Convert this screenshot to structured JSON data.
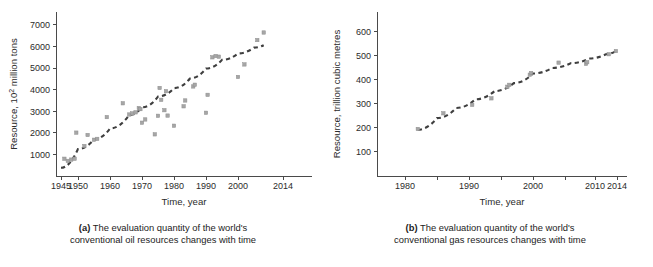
{
  "figure": {
    "panels": [
      {
        "id": "a",
        "tag": "(a)",
        "caption_line1": "The evaluation quantity of the world's",
        "caption_line2": "conventional oil resources changes with time"
      },
      {
        "id": "b",
        "tag": "(b)",
        "caption_line1": "The evaluation quantity of the world's",
        "caption_line2": "conventional gas resources changes with time"
      }
    ],
    "colors": {
      "point": "#a6a6a6",
      "trend": "#3f3f3f",
      "axis": "#4a4a4a",
      "text": "#2b2b2b",
      "background": "#ffffff"
    }
  },
  "chart_data": [
    {
      "type": "scatter",
      "panel": "a",
      "title": "",
      "xlabel": "Time, year",
      "ylabel": "Resource, 10² million tons",
      "ylabel_parts": {
        "prefix": "Resource, 10",
        "sup": "2",
        "suffix": " million tons"
      },
      "xlim": [
        1943,
        2018
      ],
      "ylim": [
        0,
        7600
      ],
      "grid": false,
      "legend": "none",
      "xticks": [
        1945,
        1950,
        1960,
        1970,
        1980,
        1990,
        2000,
        2014
      ],
      "xticklabels": [
        "1945",
        "1950",
        "1960",
        "1970",
        "1980",
        "1990",
        "2000",
        "2014"
      ],
      "yticks": [
        1000,
        2000,
        3000,
        4000,
        5000,
        6000,
        7000
      ],
      "yticklabels": [
        "1000",
        "2000",
        "3000",
        "4000",
        "5000",
        "6000",
        "7000"
      ],
      "points": [
        [
          1946,
          800
        ],
        [
          1947,
          700
        ],
        [
          1948,
          760
        ],
        [
          1949,
          800
        ],
        [
          1949.5,
          2010
        ],
        [
          1953,
          1900
        ],
        [
          1955,
          1680
        ],
        [
          1956,
          1720
        ],
        [
          1952,
          1390
        ],
        [
          1959,
          2730
        ],
        [
          1964,
          3370
        ],
        [
          1966,
          2850
        ],
        [
          1967,
          2900
        ],
        [
          1968,
          2950
        ],
        [
          1969,
          3150
        ],
        [
          1969.5,
          3100
        ],
        [
          1970,
          2470
        ],
        [
          1971,
          2620
        ],
        [
          1974,
          1930
        ],
        [
          1975,
          2790
        ],
        [
          1975.5,
          4080
        ],
        [
          1976,
          3530
        ],
        [
          1977,
          3050
        ],
        [
          1977.5,
          3930
        ],
        [
          1978,
          2800
        ],
        [
          1980,
          2330
        ],
        [
          1983,
          3230
        ],
        [
          1983.5,
          3500
        ],
        [
          1986,
          4150
        ],
        [
          1986.5,
          4230
        ],
        [
          1990,
          2930
        ],
        [
          1990.5,
          3760
        ],
        [
          1992,
          5500
        ],
        [
          1993,
          5560
        ],
        [
          1994,
          5530
        ],
        [
          2000,
          4590
        ],
        [
          2002,
          5170
        ],
        [
          2006,
          6300
        ],
        [
          2008,
          6650
        ]
      ],
      "trend_description": "dashed increasing curve from about (1945, 400) to (2008, 6050)"
    },
    {
      "type": "scatter",
      "panel": "b",
      "title": "",
      "xlabel": "Time, year",
      "ylabel": "Resource, trillion cubic metres",
      "xlim": [
        1975,
        2018
      ],
      "ylim": [
        0,
        680
      ],
      "grid": false,
      "legend": "none",
      "xticks": [
        1980,
        1985,
        1990,
        1995,
        2000,
        2005,
        2010,
        2014
      ],
      "xticklabels": [
        "1980",
        "",
        "1990",
        "",
        "2000",
        "",
        "2010",
        "2014"
      ],
      "yticks": [
        100,
        200,
        300,
        400,
        500,
        600
      ],
      "yticklabels": [
        "100",
        "200",
        "300",
        "400",
        "500",
        "600"
      ],
      "points": [
        [
          1982,
          195
        ],
        [
          1986,
          260
        ],
        [
          1990.5,
          295
        ],
        [
          1993.5,
          322
        ],
        [
          1996,
          370
        ],
        [
          1996.3,
          378
        ],
        [
          1999.5,
          420
        ],
        [
          1999.7,
          427
        ],
        [
          2004,
          470
        ],
        [
          2008.5,
          465
        ],
        [
          2008.7,
          472
        ],
        [
          2012.5,
          505
        ],
        [
          2013.8,
          518
        ]
      ],
      "trend_description": "dashed increasing concave curve from about (1982, 192) to (2013.8, 518)"
    }
  ]
}
